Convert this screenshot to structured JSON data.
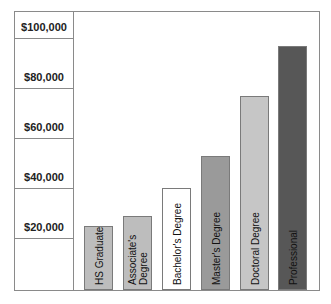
{
  "chart_data": {
    "type": "bar",
    "title": "",
    "xlabel": "",
    "ylabel": "",
    "categories": [
      "HS Graduate",
      "Associate's Degree",
      "Bachelor's Degree",
      "Master's Degree",
      "Doctoral Degree",
      "Professional"
    ],
    "values": [
      25000,
      29000,
      40000,
      53000,
      77000,
      97000
    ],
    "ylim": [
      0,
      100000
    ],
    "yticks": [
      20000,
      40000,
      60000,
      80000,
      100000
    ],
    "ytick_labels": [
      "$20,000",
      "$40,000",
      "$60,000",
      "$80,000",
      "$100,000"
    ],
    "grid": false,
    "legend": null,
    "bar_colors": [
      "#bdbdbd",
      "#bdbdbd",
      "#ffffff",
      "#9a9a9a",
      "#c6c6c6",
      "#575757"
    ],
    "labels_inside_bars": true
  },
  "axis": {
    "ticks": [
      {
        "label": "$100,000",
        "value": 100000
      },
      {
        "label": "$80,000",
        "value": 80000
      },
      {
        "label": "$60,000",
        "value": 60000
      },
      {
        "label": "$40,000",
        "value": 40000
      },
      {
        "label": "$20,000",
        "value": 20000
      }
    ]
  },
  "bars": [
    {
      "label": "HS Graduate",
      "value": 25000,
      "color": "#bdbdbd"
    },
    {
      "label": "Associate's Degree",
      "value": 29000,
      "color": "#bdbdbd"
    },
    {
      "label": "Bachelor's Degree",
      "value": 40000,
      "color": "#ffffff"
    },
    {
      "label": "Master's Degree",
      "value": 53000,
      "color": "#9a9a9a"
    },
    {
      "label": "Doctoral Degree",
      "value": 77000,
      "color": "#c6c6c6"
    },
    {
      "label": "Professional",
      "value": 97000,
      "color": "#575757"
    }
  ]
}
